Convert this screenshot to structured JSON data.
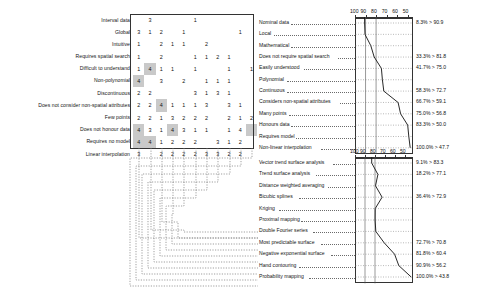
{
  "figure": {
    "type": "similarity-matrix-with-dendrograms",
    "matrix": {
      "row_labels": [
        "Interval data",
        "Global",
        "Intuitive",
        "Requires spatial search",
        "Difficult to understand",
        "Non-polynomial",
        "Discontinuous",
        "Does not consider non-spatial attributes",
        "Few points",
        "Does not honour data",
        "Requires no model",
        "Linear interpolation"
      ],
      "rows": [
        [
          "",
          "3",
          "",
          "",
          "",
          "1",
          "",
          "",
          "",
          "",
          ""
        ],
        [
          "3",
          "1",
          "2",
          "",
          "1",
          "",
          "",
          "",
          "",
          "1",
          ""
        ],
        [
          "1",
          "",
          "2",
          "1",
          "1",
          "",
          "2",
          "",
          "",
          "",
          ""
        ],
        [
          "1",
          "",
          "2",
          "",
          "",
          "1",
          "1",
          "2",
          "1",
          "",
          ""
        ],
        [
          "1",
          "4",
          "1",
          "1",
          "",
          "1",
          "",
          "",
          "1",
          "",
          "1"
        ],
        [
          "4",
          "",
          "3",
          "",
          "2",
          "",
          "1",
          "1",
          "1",
          "",
          ""
        ],
        [
          "2",
          "2",
          "",
          "",
          "",
          "3",
          "1",
          "3",
          "1",
          "",
          ""
        ],
        [
          "2",
          "2",
          "4",
          "1",
          "1",
          "1",
          "3",
          "",
          "3",
          "1",
          ""
        ],
        [
          "2",
          "2",
          "1",
          "3",
          "2",
          "2",
          "2",
          "",
          "2",
          "1",
          "2"
        ],
        [
          "4",
          "3",
          "1",
          "4",
          "3",
          "1",
          "1",
          "",
          "1",
          "4",
          ""
        ],
        [
          "4",
          "4",
          "1",
          "2",
          "2",
          "2",
          "",
          "3",
          "1",
          "2",
          ""
        ],
        [
          "3",
          "",
          "2",
          "2",
          "2",
          "2",
          "3",
          "3",
          "2",
          "2",
          ""
        ]
      ],
      "shaded": [
        [
          4,
          1
        ],
        [
          5,
          0
        ],
        [
          7,
          2
        ],
        [
          9,
          0
        ],
        [
          9,
          3
        ],
        [
          9,
          10
        ],
        [
          10,
          0
        ],
        [
          10,
          1
        ]
      ]
    },
    "top_chart": {
      "axis_ticks": [
        "100",
        "90",
        "80",
        "70",
        "60",
        "50"
      ],
      "axis_min": 45,
      "axis_max": 100,
      "labels": [
        "Nominal data",
        "Local",
        "Mathematical",
        "Does not require spatial search",
        "Easily understood",
        "Polynomial",
        "Continuous",
        "Considers non-spatial attributes",
        "Many points",
        "Honours data",
        "Requires model",
        "Non-linear interpolation"
      ],
      "values": [
        {
          "pct": "8.3% > 90.9",
          "x": 90.9
        },
        {
          "pct": "",
          "x": 90.5
        },
        {
          "pct": "",
          "x": 85.0
        },
        {
          "pct": "33.3% > 81.8",
          "x": 81.8
        },
        {
          "pct": "41.7% > 75.0",
          "x": 75.0
        },
        {
          "pct": "",
          "x": 74.0
        },
        {
          "pct": "58.3% > 72.7",
          "x": 72.7
        },
        {
          "pct": "66.7% > 59.1",
          "x": 59.1
        },
        {
          "pct": "75.0% > 56.8",
          "x": 56.8
        },
        {
          "pct": "83.3% > 50.0",
          "x": 50.0
        },
        {
          "pct": "",
          "x": 49.0
        },
        {
          "pct": "100.0% > 47.7",
          "x": 47.7
        }
      ]
    },
    "bottom_chart": {
      "axis_ticks": [
        "100",
        "90",
        "80",
        "70",
        "60",
        "50"
      ],
      "axis_min": 42,
      "axis_max": 100,
      "labels": [
        "Vector trend surface analysis",
        "Trend surface analysis",
        "Distance weighted averaging",
        "Bicubic splines",
        "Kriging",
        "Proximal mapping",
        "Double Fourier series",
        "Most predictable surface",
        "Negative exponential surface",
        "Hand contouring",
        "Probability mapping"
      ],
      "values": [
        {
          "pct": "9.1% > 83.3",
          "x": 83.3
        },
        {
          "pct": "18.2% > 77.1",
          "x": 77.1
        },
        {
          "pct": "",
          "x": 79.5
        },
        {
          "pct": "36.4% > 72.9",
          "x": 72.9
        },
        {
          "pct": "",
          "x": 79.8
        },
        {
          "pct": "",
          "x": 79.9
        },
        {
          "pct": "",
          "x": 79.2
        },
        {
          "pct": "72.7% > 70.8",
          "x": 70.8
        },
        {
          "pct": "81.8% > 60.4",
          "x": 60.4
        },
        {
          "pct": "90.9% > 56.2",
          "x": 56.2
        },
        {
          "pct": "100.0% > 43.8",
          "x": 43.8
        }
      ]
    }
  }
}
